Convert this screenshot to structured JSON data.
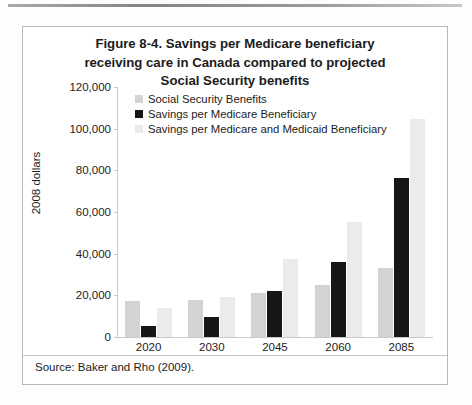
{
  "source_note": "Source: Baker and Rho (2009).",
  "chart_data": {
    "type": "bar",
    "title": "Figure 8-4. Savings per Medicare beneficiary receiving care in Canada compared to projected Social Security benefits",
    "title_lines": [
      "Figure 8-4. Savings per Medicare beneficiary",
      "receiving care in Canada compared to projected",
      "Social Security benefits"
    ],
    "xlabel": "",
    "ylabel": "2008 dollars",
    "ylim": [
      0,
      120000
    ],
    "ytick_step": 20000,
    "ytick_labels": [
      "120,000",
      "100,000",
      "80,000",
      "60,000",
      "40,000",
      "20,000",
      "0"
    ],
    "ytick_values": [
      120000,
      100000,
      80000,
      60000,
      40000,
      20000,
      0
    ],
    "grid": false,
    "legend_position": "top-left-inside",
    "categories": [
      "2020",
      "2030",
      "2045",
      "2060",
      "2085"
    ],
    "series": [
      {
        "name": "Social Security Benefits",
        "color": "#d3d3d3",
        "values": [
          17500,
          18000,
          21000,
          25000,
          33000
        ]
      },
      {
        "name": "Savings per Medicare Beneficiary",
        "color": "#171717",
        "values": [
          5300,
          9500,
          22000,
          36000,
          76500
        ]
      },
      {
        "name": "Savings per Medicare and Medicaid Beneficiary",
        "color": "#ebebeb",
        "values": [
          14000,
          19000,
          37500,
          55000,
          104500
        ]
      }
    ]
  }
}
